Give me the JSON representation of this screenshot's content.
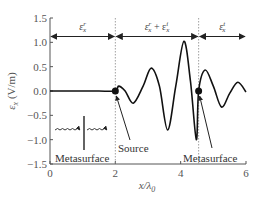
{
  "chart_data": {
    "type": "line",
    "title": "",
    "xlabel": "x/λ0",
    "ylabel": "εx (V/m)",
    "xlim": [
      0,
      6
    ],
    "ylim": [
      -1.5,
      1.5
    ],
    "xticks": [
      0,
      2,
      4,
      6
    ],
    "xtick_labels": [
      "0",
      "2",
      "4",
      "6"
    ],
    "yticks": [
      1.5,
      1.0,
      0.5,
      0.0,
      -0.5,
      -1.0,
      -1.5
    ],
    "ytick_labels": [
      "1.5",
      "1.0",
      "0.5",
      "0.0",
      "−0.5",
      "−1.0",
      "−1.5"
    ],
    "grid": false,
    "series": [
      {
        "name": "εx",
        "x": [
          0,
          0.5,
          1.0,
          1.5,
          2.0,
          2.1,
          2.3,
          2.55,
          2.85,
          3.1,
          3.35,
          3.6,
          3.85,
          4.1,
          4.3,
          4.48,
          4.55,
          4.75,
          5.0,
          5.25,
          5.5,
          5.75,
          6.0
        ],
        "y": [
          0,
          0,
          0,
          0,
          0,
          0.1,
          0.0,
          -0.25,
          0.1,
          0.47,
          0.1,
          -0.8,
          0.1,
          1.02,
          0.2,
          -1.0,
          0.0,
          0.43,
          0.1,
          -0.33,
          -0.05,
          0.18,
          -0.02
        ]
      }
    ],
    "markers": [
      {
        "name": "source",
        "x": 2.0,
        "y": 0.0
      },
      {
        "name": "metasurface",
        "x": 4.55,
        "y": 0.0
      }
    ],
    "dividers": [
      2.0,
      4.55
    ],
    "region_arrow_y": 1.12,
    "regions": [
      {
        "label_base": "ε",
        "sub": "x",
        "sup": "r",
        "from": 0,
        "to": 2.0
      },
      {
        "label_base": "ε",
        "sub": "x",
        "sup": "r",
        "plus_sup": "i",
        "from": 2.0,
        "to": 4.55
      },
      {
        "label_base": "ε",
        "sub": "x",
        "sup": "t",
        "from": 4.55,
        "to": 6.0
      }
    ],
    "annotations": [
      {
        "text": "Source",
        "points_to": [
          2.0,
          0.0
        ]
      },
      {
        "text": "Metasurface",
        "points_to": [
          4.55,
          0.0
        ]
      },
      {
        "text": "Metasurface",
        "role": "inset-label"
      }
    ]
  },
  "labels": {
    "xlabel_main": "x/λ",
    "xlabel_sub": "0",
    "ylabel_main": "ε",
    "ylabel_sub": "x",
    "ylabel_unit": " (V/m)",
    "source": "Source",
    "metasurface": "Metasurface",
    "inset_metasurface": "Metasurface"
  }
}
